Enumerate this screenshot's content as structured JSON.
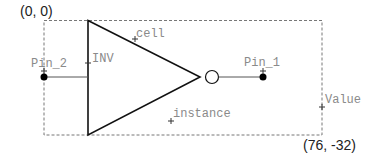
{
  "diagram": {
    "origin_label": "(0, 0)",
    "extent_label": "(76, -32)",
    "cell_label": "cell",
    "inv_label": "INV",
    "instance_label": "instance",
    "value_label": "Value",
    "pins": [
      {
        "name": "Pin_2",
        "side": "left"
      },
      {
        "name": "Pin_1",
        "side": "right"
      }
    ],
    "colors": {
      "outline": "#111111",
      "bbox": "#777777",
      "label": "#8a8a8a"
    }
  }
}
